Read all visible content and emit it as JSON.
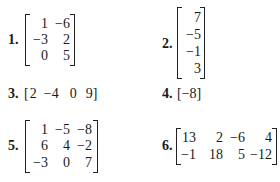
{
  "exercises": [
    {
      "label": "1.",
      "rows": [
        [
          "1",
          "−6"
        ],
        [
          "−3",
          "2"
        ],
        [
          "0",
          "5"
        ]
      ]
    },
    {
      "label": "2.",
      "rows": [
        [
          "7"
        ],
        [
          "−5"
        ],
        [
          "−1"
        ],
        [
          "3"
        ]
      ]
    },
    {
      "label": "3.",
      "open": "[",
      "values": [
        "2",
        "−4",
        "0",
        "9"
      ],
      "close": "]"
    },
    {
      "label": "4.",
      "open": "[",
      "values": [
        "−8"
      ],
      "close": "]"
    },
    {
      "label": "5.",
      "rows": [
        [
          "1",
          "−5",
          "−8"
        ],
        [
          "6",
          "4",
          "−2"
        ],
        [
          "−3",
          "0",
          "7"
        ]
      ]
    },
    {
      "label": "6.",
      "rows": [
        [
          "13",
          "2",
          "−6",
          "4"
        ],
        [
          "−1",
          "18",
          "5",
          "−12"
        ]
      ]
    }
  ]
}
